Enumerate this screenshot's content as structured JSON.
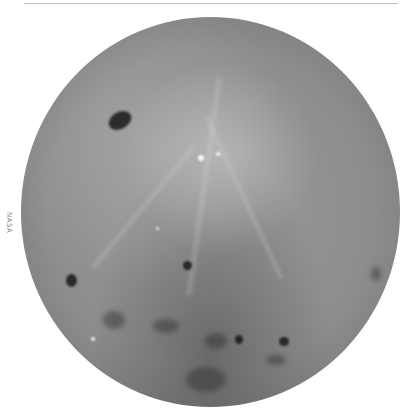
{
  "image": {
    "subject": "Full disc of the Moon (far side), grayscale",
    "credit_text": "NASA"
  },
  "colors": {
    "background": "#ffffff",
    "moon_base": "#8d8d8d",
    "mare_dark": "#191919",
    "highlight": "#ffffff"
  }
}
